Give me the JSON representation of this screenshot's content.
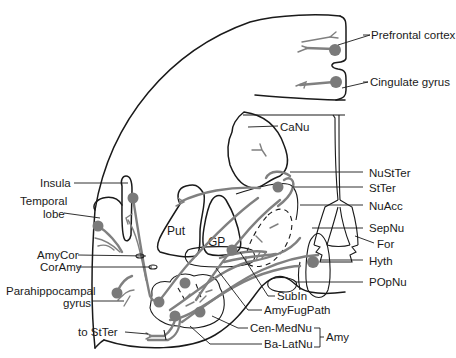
{
  "diagram": {
    "regions": {
      "put": "Put",
      "gp": "GP"
    },
    "labels_right": {
      "prefrontal": "Prefrontal cortex",
      "cingulate": "Cingulate gyrus",
      "canu": "CaNu",
      "nustter": "NuStTer",
      "stter": "StTer",
      "nuacc": "NuAcc",
      "sepnu": "SepNu",
      "for": "For",
      "hyth": "Hyth",
      "popnu": "POpNu",
      "subin": "SubIn",
      "amyfugpath": "AmyFugPath",
      "cenmednu": "Cen-MedNu",
      "balatnu": "Ba-LatNu",
      "amy": "Amy"
    },
    "labels_left": {
      "insula": "Insula",
      "temporal_1": "Temporal",
      "temporal_2": "lobe",
      "amycor": "AmyCor",
      "coramy": "CorAmy",
      "parahippo_1": "Parahippocampal",
      "parahippo_2": "gyrus",
      "to_stter": "to StTer"
    },
    "colors": {
      "outline": "#1a1a1a",
      "pathway": "#808080",
      "cell_body": "#7a7a7a",
      "background": "#ffffff"
    }
  }
}
